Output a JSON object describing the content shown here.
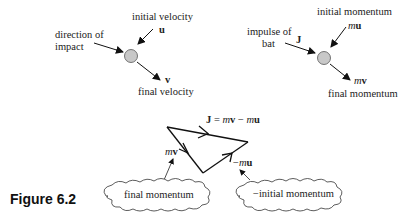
{
  "left_diagram": {
    "initial_label": "initial velocity",
    "initial_symbol": "u",
    "impact_label_line1": "direction of",
    "impact_label_line2": "impact",
    "final_symbol": "v",
    "final_label": "final velocity"
  },
  "right_diagram": {
    "initial_label": "initial momentum",
    "initial_symbol_m": "m",
    "initial_symbol_u": "u",
    "impulse_label_line1": "impulse of",
    "impulse_label_line2": "bat",
    "impulse_symbol": "J",
    "final_symbol_m": "m",
    "final_symbol_v": "v",
    "final_label": "final momentum"
  },
  "triangle": {
    "equation_J": "J",
    "equation_rest": " = ",
    "eq_m1": "m",
    "eq_v": "v",
    "eq_minus": " − ",
    "eq_m2": "m",
    "eq_u": "u",
    "mv_m": "m",
    "mv_v": "v",
    "neg_mu_minus": "−",
    "neg_mu_m": "m",
    "neg_mu_u": "u",
    "cloud_left": "final momentum",
    "cloud_right": "−initial momentum"
  },
  "caption": "Figure 6.2",
  "colors": {
    "ball": "#c8c8c8",
    "ink": "#1a1a1a"
  }
}
